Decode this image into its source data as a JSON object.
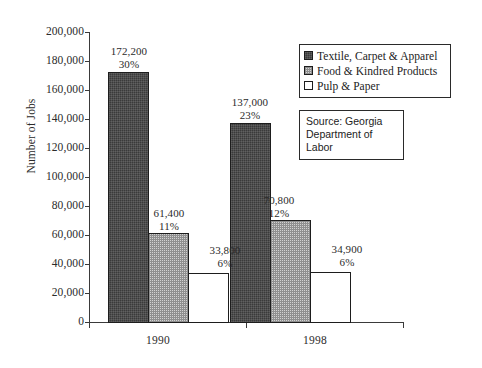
{
  "chart_data": {
    "type": "bar",
    "title": "",
    "xlabel": "",
    "ylabel": "Number of Jobs",
    "categories": [
      "1990",
      "1998"
    ],
    "ylim": [
      0,
      200000
    ],
    "ytick_step": 20000,
    "yticks": [
      "0",
      "20,000",
      "40,000",
      "60,000",
      "80,000",
      "100,000",
      "120,000",
      "140,000",
      "160,000",
      "180,000",
      "200,000"
    ],
    "grid": false,
    "legend_position": "top-right",
    "series": [
      {
        "name": "Textile, Carpet & Apparel",
        "swatch": "dark-crosshatch",
        "color": "#3a3a3a",
        "values": [
          172200,
          137000
        ],
        "value_labels": [
          "172,200",
          "137,000"
        ],
        "percent_labels": [
          "30%",
          "23%"
        ]
      },
      {
        "name": "Food & Kindred Products",
        "swatch": "gray-dotted",
        "color": "#d2d2d2",
        "values": [
          61400,
          70800
        ],
        "value_labels": [
          "61,400",
          "70,800"
        ],
        "percent_labels": [
          "11%",
          "12%"
        ]
      },
      {
        "name": "Pulp & Paper",
        "swatch": "white",
        "color": "#ffffff",
        "values": [
          33800,
          34900
        ],
        "value_labels": [
          "33,800",
          "34,900"
        ],
        "percent_labels": [
          "6%",
          "6%"
        ]
      }
    ],
    "annotations": [
      {
        "name": "source-note",
        "lines": [
          "Source: Georgia",
          "Department of",
          "Labor"
        ]
      }
    ]
  },
  "legend": {
    "items": [
      {
        "label": "Textile, Carpet & Apparel"
      },
      {
        "label": "Food & Kindred Products"
      },
      {
        "label": "Pulp & Paper"
      }
    ]
  },
  "source_note": {
    "line1": "Source: Georgia",
    "line2": "Department of",
    "line3": "Labor"
  }
}
